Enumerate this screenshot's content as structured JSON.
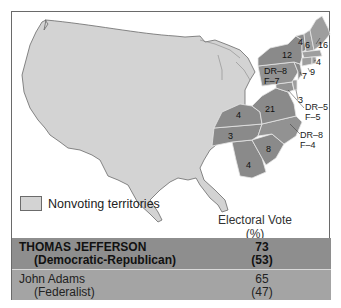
{
  "colors": {
    "nonvoting": "#d3d3d3",
    "democratic_republican": "#8a8a8a",
    "federalist": "#9e9e9e",
    "split": "#929292",
    "border": "#6a6a6a"
  },
  "legend": {
    "label": "Nonvoting territories"
  },
  "states": [
    {
      "name": "New Hampshire",
      "label": "6",
      "party": "federalist"
    },
    {
      "name": "Vermont",
      "label": "4",
      "party": "democratic_republican"
    },
    {
      "name": "Massachusetts",
      "label": "16",
      "party": "federalist"
    },
    {
      "name": "Rhode Island",
      "label": "4",
      "party": "federalist"
    },
    {
      "name": "Connecticut",
      "label": "9",
      "party": "federalist"
    },
    {
      "name": "New York",
      "label": "12",
      "party": "democratic_republican"
    },
    {
      "name": "New Jersey",
      "label": "7",
      "party": "democratic_republican"
    },
    {
      "name": "Pennsylvania",
      "label_line1": "DR–8",
      "label_line2": "F–7",
      "party": "split"
    },
    {
      "name": "Delaware",
      "label": "3",
      "party": "federalist"
    },
    {
      "name": "Maryland",
      "label_line1": "DR–5",
      "label_line2": "F–5",
      "party": "split"
    },
    {
      "name": "Virginia",
      "label": "21",
      "party": "democratic_republican"
    },
    {
      "name": "North Carolina",
      "label_line1": "DR–8",
      "label_line2": "F–4",
      "party": "split"
    },
    {
      "name": "Kentucky",
      "label": "4",
      "party": "democratic_republican"
    },
    {
      "name": "Tennessee",
      "label": "3",
      "party": "democratic_republican"
    },
    {
      "name": "South Carolina",
      "label": "8",
      "party": "democratic_republican"
    },
    {
      "name": "Georgia",
      "label": "4",
      "party": "democratic_republican"
    }
  ],
  "table": {
    "header_line1": "Electoral Vote",
    "header_line2": "(%)",
    "rows": [
      {
        "candidate": "THOMAS JEFFERSON",
        "party": "(Democratic-Republican)",
        "votes": "73",
        "percent": "(53)"
      },
      {
        "candidate": "John Adams",
        "party": "(Federalist)",
        "votes": "65",
        "percent": "(47)"
      }
    ]
  }
}
